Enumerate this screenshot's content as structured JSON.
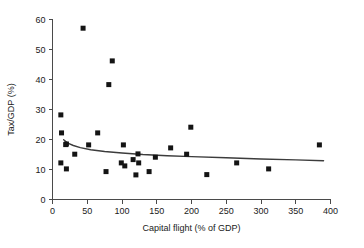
{
  "chart_data": {
    "type": "scatter",
    "title": "",
    "xlabel": "Capital flight (% of GDP)",
    "ylabel": "Tax/GDP (%)",
    "xlim": [
      0,
      400
    ],
    "ylim": [
      0,
      60
    ],
    "xticks": [
      0,
      50,
      100,
      150,
      200,
      250,
      300,
      350,
      400
    ],
    "xtick_labels": [
      "0",
      "50",
      "100",
      "150",
      "200",
      "250",
      "300",
      "350",
      "400"
    ],
    "yticks": [
      0,
      10,
      20,
      30,
      40,
      50,
      60
    ],
    "ytick_labels": [
      "0",
      "10",
      "20",
      "30",
      "40",
      "50",
      "60"
    ],
    "grid": false,
    "legend": false,
    "marker": "square",
    "marker_color": "#141414",
    "line_color": "#3c3c3c",
    "axis_color": "#4a4a4a",
    "background": "#ffffff",
    "points": [
      {
        "x": 12,
        "y": 28.2
      },
      {
        "x": 13,
        "y": 22.2
      },
      {
        "x": 12,
        "y": 12.2
      },
      {
        "x": 19,
        "y": 18.3
      },
      {
        "x": 20,
        "y": 18.5
      },
      {
        "x": 20,
        "y": 10.2
      },
      {
        "x": 32,
        "y": 15.1
      },
      {
        "x": 44,
        "y": 57.1
      },
      {
        "x": 52,
        "y": 18.2
      },
      {
        "x": 65,
        "y": 22.2
      },
      {
        "x": 77,
        "y": 9.3
      },
      {
        "x": 81,
        "y": 38.3
      },
      {
        "x": 86,
        "y": 46.2
      },
      {
        "x": 99,
        "y": 12.2
      },
      {
        "x": 102,
        "y": 18.2
      },
      {
        "x": 104,
        "y": 11.2
      },
      {
        "x": 116,
        "y": 13.3
      },
      {
        "x": 120,
        "y": 8.2
      },
      {
        "x": 123,
        "y": 15.2
      },
      {
        "x": 124,
        "y": 12.2
      },
      {
        "x": 139,
        "y": 9.3
      },
      {
        "x": 148,
        "y": 14.1
      },
      {
        "x": 170,
        "y": 17.2
      },
      {
        "x": 193,
        "y": 15.1
      },
      {
        "x": 199,
        "y": 24.1
      },
      {
        "x": 222,
        "y": 8.3
      },
      {
        "x": 265,
        "y": 12.2
      },
      {
        "x": 311,
        "y": 10.2
      },
      {
        "x": 384,
        "y": 18.2
      }
    ],
    "trend_line": {
      "name": "fitted curve",
      "points": [
        {
          "x": 16,
          "y": 19.9
        },
        {
          "x": 22,
          "y": 18.8
        },
        {
          "x": 30,
          "y": 18.0
        },
        {
          "x": 40,
          "y": 17.3
        },
        {
          "x": 55,
          "y": 16.6
        },
        {
          "x": 75,
          "y": 16.0
        },
        {
          "x": 100,
          "y": 15.5
        },
        {
          "x": 130,
          "y": 15.0
        },
        {
          "x": 165,
          "y": 14.6
        },
        {
          "x": 200,
          "y": 14.3
        },
        {
          "x": 250,
          "y": 13.9
        },
        {
          "x": 300,
          "y": 13.5
        },
        {
          "x": 350,
          "y": 13.2
        },
        {
          "x": 390,
          "y": 12.9
        }
      ]
    }
  }
}
